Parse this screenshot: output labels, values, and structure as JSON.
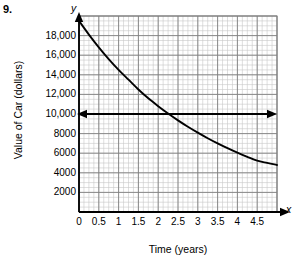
{
  "problem": {
    "number": "9."
  },
  "chart_data": {
    "type": "line",
    "title": "",
    "xlabel": "Time (years)",
    "ylabel": "Value of Car (dollars)",
    "x_axis_letter": "x",
    "y_axis_letter": "y",
    "xlim": [
      0,
      5
    ],
    "ylim": [
      0,
      20000
    ],
    "grid": true,
    "grid_minor_x_step": 0.125,
    "grid_minor_y_step": 500,
    "grid_major_x_step": 0.5,
    "grid_major_y_step": 2000,
    "legend": "none",
    "x_ticks": [
      "0",
      "0.5",
      "1",
      "1.5",
      "2",
      "2.5",
      "3",
      "3.5",
      "4",
      "4.5"
    ],
    "x_tick_values": [
      0,
      0.5,
      1,
      1.5,
      2,
      2.5,
      3,
      3.5,
      4,
      4.5
    ],
    "y_ticks": [
      "2000",
      "4000",
      "6000",
      "8000",
      "10,000",
      "12,000",
      "14,000",
      "16,000",
      "18,000"
    ],
    "y_tick_values": [
      2000,
      4000,
      6000,
      8000,
      10000,
      12000,
      14000,
      16000,
      18000
    ],
    "series": [
      {
        "name": "Value of Car",
        "kind": "exponential-decay-curve",
        "x": [
          0,
          0.25,
          0.5,
          0.75,
          1,
          1.25,
          1.5,
          1.75,
          2,
          2.25,
          2.5,
          2.75,
          3,
          3.25,
          3.5,
          3.75,
          4,
          4.25,
          4.5,
          4.75,
          5
        ],
        "values": [
          19500,
          18100,
          16800,
          15600,
          14500,
          13500,
          12500,
          11600,
          10800,
          10050,
          9350,
          8700,
          8100,
          7530,
          7000,
          6510,
          6050,
          5630,
          5240,
          5010,
          4800
        ]
      }
    ],
    "annotations": [
      {
        "name": "horizontal-reference-arrow",
        "kind": "double-headed-arrow",
        "y_value": 10000,
        "x_start": 0,
        "x_end": 4.95,
        "color": "#000000"
      }
    ],
    "colors": {
      "curve": "#000000",
      "axis": "#000000",
      "grid_minor": "#c8c8c8",
      "grid_major": "#808080",
      "background": "#ffffff"
    }
  }
}
